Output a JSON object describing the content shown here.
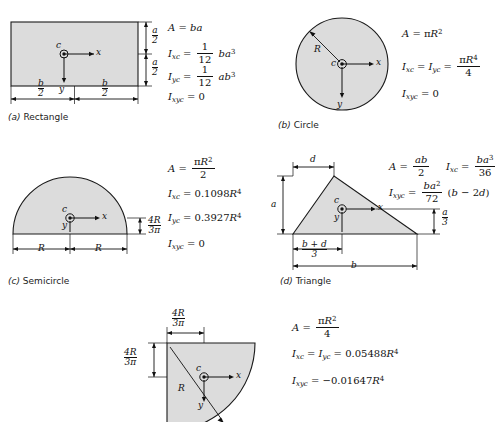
{
  "page": {
    "top_cut_text": "",
    "shape_fill": "#dcdcdc",
    "stroke": "#1a1a1a"
  },
  "figures": [
    {
      "key": "rectangle",
      "caption_label": "(a)",
      "caption_name": "Rectangle",
      "axis_x": "x",
      "axis_y": "y",
      "centroid": "c",
      "dims": {
        "half_height_num": "a",
        "half_height_den": "2",
        "half_width_num": "b",
        "half_width_den": "2"
      },
      "equations": [
        {
          "name": "area",
          "text": "A = ba"
        },
        {
          "name": "ixc",
          "text": "Ixc = (1/12) b a^3"
        },
        {
          "name": "iyc",
          "text": "Iyc = (1/12) a b^3"
        },
        {
          "name": "ixyc",
          "text": "Ixyc = 0"
        }
      ]
    },
    {
      "key": "circle",
      "caption_label": "(b)",
      "caption_name": "Circle",
      "axis_x": "x",
      "axis_y": "y",
      "centroid": "c",
      "dims": {
        "radius": "R"
      },
      "equations": [
        {
          "name": "area",
          "text": "A = pi R^2"
        },
        {
          "name": "ixc-iyc",
          "text": "Ixc = Iyc = pi R^4 / 4"
        },
        {
          "name": "ixyc",
          "text": "Ixyc = 0"
        }
      ]
    },
    {
      "key": "semicircle",
      "caption_label": "(c)",
      "caption_name": "Semicircle",
      "axis_x": "x",
      "axis_y": "y",
      "centroid": "c",
      "dims": {
        "radius_left": "R",
        "radius_right": "R",
        "centroid_offset_num": "4R",
        "centroid_offset_den": "3π"
      },
      "equations": [
        {
          "name": "area",
          "text": "A = pi R^2 / 2"
        },
        {
          "name": "ixc",
          "text": "Ixc = 0.1098 R^4"
        },
        {
          "name": "iyc",
          "text": "Iyc = 0.3927 R^4"
        },
        {
          "name": "ixyc",
          "text": "Ixyc = 0"
        }
      ]
    },
    {
      "key": "triangle",
      "caption_label": "(d)",
      "caption_name": "Triangle",
      "axis_x": "x",
      "axis_y": "y",
      "centroid": "c",
      "dims": {
        "apex_offset": "d",
        "height": "a",
        "centroid_height_num": "a",
        "centroid_height_den": "3",
        "centroid_x_num": "b + d",
        "centroid_x_den": "3",
        "base": "b"
      },
      "equations": [
        {
          "name": "area",
          "text": "A = ab / 2"
        },
        {
          "name": "ixc",
          "text": "Ixc = b a^3 / 36"
        },
        {
          "name": "ixyc",
          "text": "Ixyc = (b a^2 / 72)(b - 2d)"
        }
      ]
    },
    {
      "key": "quarter-circle",
      "caption_label": "",
      "caption_name": "",
      "axis_x": "x",
      "axis_y": "y",
      "centroid": "c",
      "dims": {
        "radius": "R",
        "centroid_x_num": "4R",
        "centroid_x_den": "3π",
        "centroid_y_num": "4R",
        "centroid_y_den": "3π"
      },
      "equations": [
        {
          "name": "area",
          "text": "A = pi R^2 / 4"
        },
        {
          "name": "ixc-iyc",
          "text": "Ixc = Iyc = 0.05488 R^4"
        },
        {
          "name": "ixyc",
          "text": "Ixyc = -0.01647 R^4"
        }
      ]
    }
  ],
  "symbols": {
    "pi": "π",
    "minus": "−",
    "A": "A",
    "eq": "=",
    "I": "I",
    "zero": "0",
    "one": "1",
    "twelve": "12",
    "two": "2",
    "three": "3",
    "four": "4",
    "36": "36",
    "72": "72",
    "b": "b",
    "a": "a",
    "d": "d",
    "R": "R",
    "val_01098": "0.1098",
    "val_03927": "0.3927",
    "val_005488": "0.05488",
    "val_001647": "0.01647",
    "sub_xc": "xc",
    "sub_yc": "yc",
    "sub_xyc": "xyc",
    "sup2": "2",
    "sup3": "3",
    "sup4": "4"
  }
}
